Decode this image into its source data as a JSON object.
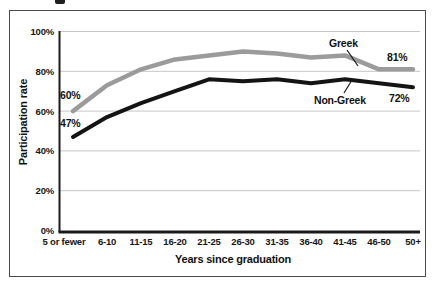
{
  "frame": {
    "border_color": "#4a4a4a",
    "background": "#ffffff"
  },
  "chart_data": {
    "type": "line",
    "title": "",
    "xlabel": "Years since graduation",
    "ylabel": "Participation rate",
    "categories": [
      "5 or fewer",
      "6-10",
      "11-15",
      "16-20",
      "21-25",
      "26-30",
      "31-35",
      "36-40",
      "41-45",
      "46-50",
      "50+"
    ],
    "series": [
      {
        "name": "Greek",
        "color": "#9b9b9b",
        "values": [
          60,
          73,
          81,
          86,
          88,
          90,
          89,
          87,
          88,
          81,
          81
        ]
      },
      {
        "name": "Non-Greek",
        "color": "#141414",
        "values": [
          47,
          57,
          64,
          70,
          76,
          75,
          76,
          74,
          76,
          74,
          72
        ]
      }
    ],
    "ylim": [
      0,
      100
    ],
    "yticks": [
      0,
      20,
      40,
      60,
      80,
      100
    ],
    "ytick_suffix": "%",
    "grid": true,
    "gridline_color": "#c6c6c6",
    "axis_color": "#1a1a1a",
    "legend_position": "inline-annotations",
    "annotations": {
      "greek_start": "60%",
      "nongreek_start": "47%",
      "greek_end": "81%",
      "nongreek_end": "72%"
    }
  }
}
